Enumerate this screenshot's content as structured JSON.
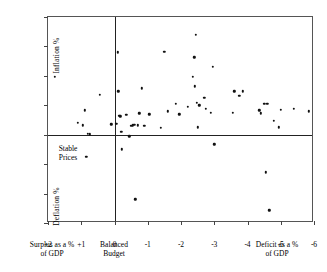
{
  "chart_data": {
    "type": "scatter",
    "title": "",
    "xlabel": "Budget balance as a % of GDP",
    "ylabel": "Inflation / Deflation %",
    "xlim": [
      2,
      -6
    ],
    "ylim": [
      -12,
      16
    ],
    "grid": false,
    "legend": "none",
    "x_ticks": [
      "+2",
      "+1",
      "0",
      "-1",
      "-2",
      "-3",
      "-4",
      "-5",
      "-6"
    ],
    "x_tick_values": [
      2,
      1,
      0,
      -1,
      -2,
      -3,
      -4,
      -5,
      -6
    ],
    "y_ticks": [
      "16",
      "12",
      "8",
      "4",
      "0",
      "-4",
      "-8",
      "-12"
    ],
    "y_tick_values": [
      16,
      12,
      8,
      4,
      0,
      -4,
      -8,
      -12
    ],
    "zero_lines": {
      "x": 0,
      "y": 0
    },
    "annotations": {
      "y_upper_title": "Inflation %",
      "y_lower_title": "Deflation %",
      "y_zero_label": "Stable\nPrices",
      "x_left_caption": "Surplus as a %\nof GDP",
      "x_center_caption": "Balanced\nBudget",
      "x_right_caption": "Deficit as a %\nof GDP"
    },
    "points": [
      [
        1.8,
        7.9
      ],
      [
        1.1,
        1.6
      ],
      [
        0.95,
        1.3
      ],
      [
        0.9,
        3.3
      ],
      [
        0.85,
        -3.0
      ],
      [
        0.8,
        0.1
      ],
      [
        0.75,
        0.05
      ],
      [
        0.45,
        5.4
      ],
      [
        0.1,
        1.4
      ],
      [
        -0.05,
        1.5
      ],
      [
        -0.1,
        11.2
      ],
      [
        -0.12,
        5.9
      ],
      [
        -0.15,
        2.6
      ],
      [
        -0.18,
        2.5
      ],
      [
        -0.2,
        0.4
      ],
      [
        -0.22,
        -2.0
      ],
      [
        -0.35,
        2.7
      ],
      [
        -0.45,
        -0.2
      ],
      [
        -0.5,
        1.2
      ],
      [
        -0.55,
        1.3
      ],
      [
        -0.6,
        1.35
      ],
      [
        -0.62,
        -8.8
      ],
      [
        -0.7,
        1.3
      ],
      [
        -0.75,
        2.9
      ],
      [
        -0.82,
        6.3
      ],
      [
        -0.9,
        1.2
      ],
      [
        -1.05,
        2.8
      ],
      [
        -1.4,
        0.9
      ],
      [
        -1.5,
        11.3
      ],
      [
        -1.6,
        3.2
      ],
      [
        -1.85,
        4.2
      ],
      [
        -1.95,
        2.8
      ],
      [
        -2.2,
        3.8
      ],
      [
        -2.35,
        7.9
      ],
      [
        -2.4,
        10.5
      ],
      [
        -2.42,
        6.6
      ],
      [
        -2.45,
        13.6
      ],
      [
        -2.48,
        4.3
      ],
      [
        -2.5,
        1.0
      ],
      [
        -2.55,
        4.0
      ],
      [
        -2.7,
        5.0
      ],
      [
        -2.75,
        3.5
      ],
      [
        -2.9,
        3.0
      ],
      [
        -2.95,
        9.2
      ],
      [
        -3.0,
        -1.3
      ],
      [
        -3.55,
        3.0
      ],
      [
        -3.6,
        5.9
      ],
      [
        -3.75,
        5.3
      ],
      [
        -3.85,
        5.9
      ],
      [
        -4.35,
        3.3
      ],
      [
        -4.4,
        2.9
      ],
      [
        -4.5,
        4.2
      ],
      [
        -4.55,
        -5.1
      ],
      [
        -4.6,
        4.2
      ],
      [
        -4.65,
        -10.3
      ],
      [
        -4.8,
        1.9
      ],
      [
        -4.95,
        1.0
      ],
      [
        -5.0,
        3.4
      ],
      [
        -5.4,
        3.5
      ],
      [
        -5.85,
        3.2
      ]
    ]
  }
}
